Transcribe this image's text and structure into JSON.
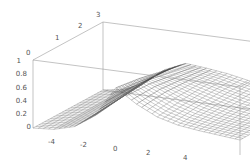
{
  "chart_data": {
    "type": "surface3d",
    "title": "",
    "xlabel": "",
    "ylabel": "",
    "zlabel": "",
    "x_range": [
      -5,
      5
    ],
    "y_range": [
      0,
      3
    ],
    "z_range": [
      0,
      1
    ],
    "x_ticks": [
      "-4",
      "-2",
      "0",
      "2",
      "4"
    ],
    "y_ticks": [
      "0",
      "1",
      "2",
      "3"
    ],
    "z_ticks": [
      "0",
      "0.2",
      "0.4",
      "0.6",
      "0.8",
      "1"
    ],
    "grid": false,
    "legend": null,
    "surface_samples": {
      "x": [
        -5,
        -4,
        -3,
        -2,
        -1,
        0,
        1,
        2,
        3,
        4,
        5
      ],
      "y": [
        0,
        1,
        2,
        3
      ],
      "z": [
        [
          0.0,
          0.02,
          0.1,
          0.3,
          0.75,
          0.55,
          0.4,
          0.32,
          0.28,
          0.25,
          0.22
        ],
        [
          0.0,
          0.03,
          0.12,
          0.35,
          0.7,
          0.58,
          0.45,
          0.36,
          0.3,
          0.26,
          0.23
        ],
        [
          0.0,
          0.04,
          0.15,
          0.4,
          0.62,
          0.55,
          0.48,
          0.4,
          0.33,
          0.28,
          0.25
        ],
        [
          0.0,
          0.05,
          0.18,
          0.42,
          0.55,
          0.52,
          0.48,
          0.42,
          0.36,
          0.3,
          0.27
        ]
      ]
    }
  }
}
